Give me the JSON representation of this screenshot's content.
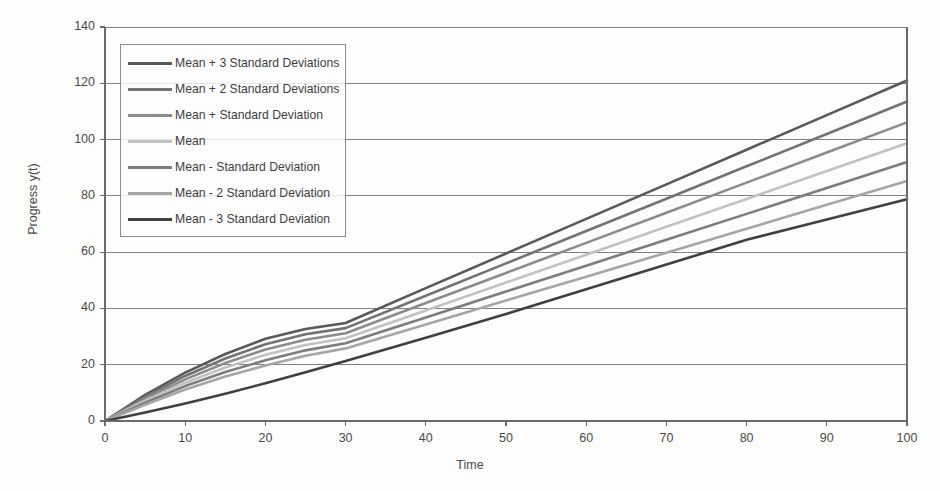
{
  "chart_data": {
    "type": "line",
    "title": "",
    "xlabel": "Time",
    "ylabel": "Progress y(t)",
    "xlim": [
      0,
      100
    ],
    "ylim": [
      0,
      140
    ],
    "xticks": [
      "0",
      "10",
      "20",
      "30",
      "40",
      "50",
      "60",
      "70",
      "80",
      "90",
      "100"
    ],
    "yticks": [
      "0",
      "20",
      "40",
      "60",
      "80",
      "100",
      "120",
      "140"
    ],
    "grid": "horizontal",
    "legend_position": "upper-left-inside",
    "x": [
      0,
      5,
      10,
      15,
      20,
      25,
      30,
      40,
      50,
      60,
      70,
      80,
      90,
      100
    ],
    "series": [
      {
        "name": "Mean + 3 Standard Deviations",
        "color": "#595959",
        "values": [
          0,
          9.3,
          17.2,
          23.8,
          29.2,
          32.7,
          34.8,
          47.2,
          59.5,
          71.8,
          84.1,
          96.4,
          108.7,
          121.0
        ]
      },
      {
        "name": "Mean + 2 Standard Deviations",
        "color": "#737373",
        "values": [
          0,
          8.6,
          16.0,
          22.2,
          27.3,
          30.8,
          33.0,
          44.5,
          56.0,
          67.5,
          79.0,
          90.5,
          102.0,
          113.5
        ]
      },
      {
        "name": "Mean + Standard Deviation",
        "color": "#8c8c8c",
        "values": [
          0,
          7.9,
          14.8,
          20.6,
          25.4,
          28.9,
          31.2,
          41.9,
          52.6,
          63.3,
          74.0,
          84.7,
          95.4,
          106.1
        ]
      },
      {
        "name": "Mean",
        "color": "#c2c2c2",
        "values": [
          0,
          7.2,
          13.6,
          19.0,
          23.5,
          27.0,
          29.4,
          39.3,
          49.2,
          59.1,
          69.0,
          78.9,
          88.8,
          98.7
        ]
      },
      {
        "name": "Mean - Standard Deviation",
        "color": "#7d7d7d",
        "values": [
          0,
          6.5,
          12.4,
          17.4,
          21.6,
          25.1,
          27.6,
          36.8,
          46.0,
          55.2,
          64.4,
          73.6,
          82.8,
          92.0
        ]
      },
      {
        "name": "Mean - 2 Standard Deviation",
        "color": "#a6a6a6",
        "values": [
          0,
          5.8,
          11.2,
          15.8,
          19.7,
          23.2,
          25.8,
          34.3,
          42.8,
          51.3,
          59.8,
          68.3,
          76.8,
          85.3
        ]
      },
      {
        "name": "Mean - 3 Standard Deviation",
        "color": "#404040",
        "values": [
          0,
          3.0,
          6.2,
          9.7,
          13.4,
          17.3,
          21.3,
          29.6,
          38.0,
          46.8,
          55.6,
          64.4,
          71.6,
          78.8
        ]
      }
    ]
  },
  "axes": {
    "x_title": "Time",
    "y_title": "Progress y(t)"
  },
  "legend": {
    "items": [
      {
        "label": "Mean + 3 Standard Deviations",
        "color": "#595959"
      },
      {
        "label": "Mean + 2 Standard Deviations",
        "color": "#737373"
      },
      {
        "label": "Mean + Standard Deviation",
        "color": "#8c8c8c"
      },
      {
        "label": "Mean",
        "color": "#c2c2c2"
      },
      {
        "label": "Mean - Standard Deviation",
        "color": "#7d7d7d"
      },
      {
        "label": "Mean - 2 Standard Deviation",
        "color": "#a6a6a6"
      },
      {
        "label": "Mean - 3 Standard Deviation",
        "color": "#404040"
      }
    ]
  },
  "style": {
    "grid_color": "#808080",
    "axis_color": "#6b6b6b",
    "background": "#fdfdfc",
    "text_color": "#4a4a4a"
  }
}
